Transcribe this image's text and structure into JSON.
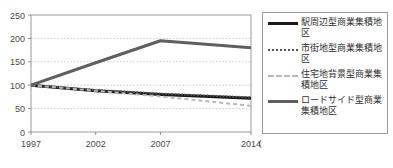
{
  "chart_data": {
    "type": "line",
    "title": "",
    "xlabel": "（年）",
    "ylabel": "",
    "x": [
      1997,
      2002,
      2007,
      2014
    ],
    "categories": [
      "1997",
      "2002",
      "2007",
      "2014"
    ],
    "xlim": [
      1997,
      2014
    ],
    "ylim": [
      0,
      250
    ],
    "yticks": [
      0,
      50,
      100,
      150,
      200,
      250
    ],
    "ytick_labels": [
      "0",
      "50",
      "100",
      "150",
      "200",
      "250"
    ],
    "grid": "horizontal-dotted",
    "legend_position": "right",
    "series": [
      {
        "name": "駅周辺型商業集積地区",
        "values": [
          100,
          88,
          80,
          72
        ],
        "color": "#1a1a1a",
        "style": "solid",
        "width": 3
      },
      {
        "name": "市街地型商業集積地区",
        "values": [
          100,
          90,
          82,
          74
        ],
        "color": "#555555",
        "style": "dotted",
        "width": 2
      },
      {
        "name": "住宅地背景型商業集積地区",
        "values": [
          100,
          88,
          76,
          56
        ],
        "color": "#b8b8b8",
        "style": "dashed",
        "width": 2
      },
      {
        "name": "ロードサイド型商業集積地区",
        "values": [
          100,
          148,
          195,
          180
        ],
        "color": "#5f5f5f",
        "style": "solid",
        "width": 3
      }
    ]
  },
  "legend": {
    "items": [
      {
        "label": "駅周辺型商業集積地区",
        "swatch": "sw-solid-black"
      },
      {
        "label": "市街地型商業集積地区",
        "swatch": "sw-dotted"
      },
      {
        "label": "住宅地背景型商業集積地区",
        "swatch": "sw-dashed-gray"
      },
      {
        "label": "ロードサイド型商業集積地区",
        "swatch": "sw-solid-gray"
      }
    ]
  },
  "axis": {
    "x_unit_label": "（年）"
  }
}
